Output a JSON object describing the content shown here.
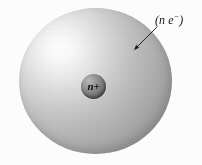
{
  "figure": {
    "background_color": "#fcfcfc"
  },
  "electron_cloud": {
    "name": "electron-cloud",
    "label_text": "(n e",
    "label_superscript": "−",
    "label_close": ")",
    "highlight_color": "#ffffff",
    "mid_color": "#bcbcbc",
    "shadow_color": "#8c8c8c",
    "center_x": 95,
    "center_y": 81,
    "radius_x": 76,
    "radius_y": 73
  },
  "nucleus": {
    "name": "nucleus",
    "label": "n+",
    "highlight_color": "#b9b9b9",
    "base_color": "#777777",
    "shadow_color": "#5c5c5c",
    "center_x": 93,
    "center_y": 86,
    "radius": 12
  },
  "leader_arrow": {
    "name": "leader-arrow",
    "color": "#151515",
    "start_x": 157,
    "start_y": 27,
    "end_x": 131,
    "end_y": 53
  }
}
